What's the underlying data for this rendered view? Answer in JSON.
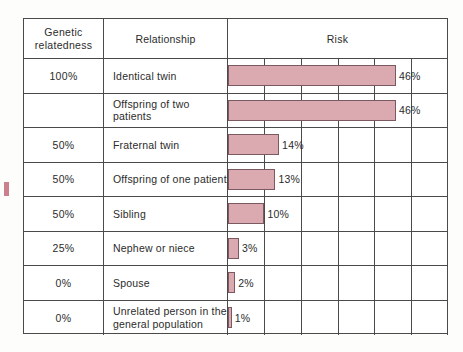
{
  "figure": {
    "headers": {
      "genetic": "Genetic\nrelatedness",
      "genetic_line1": "Genetic",
      "genetic_line2": "relatedness",
      "relationship": "Relationship",
      "risk": "Risk"
    },
    "artifact_glyph": "f"
  },
  "chart_data": {
    "type": "bar",
    "orientation": "horizontal",
    "title": "Risk",
    "xlabel": "",
    "ylabel": "",
    "xlim": [
      0,
      60
    ],
    "grid": true,
    "gridline_values": [
      10,
      20,
      30,
      40,
      50,
      60
    ],
    "bar_color": "#dba9b0",
    "bar_border_color": "#7a5a60",
    "categories": [
      "Identical twin",
      "Offspring of two patients",
      "Fraternal twin",
      "Offspring of one patient",
      "Sibling",
      "Nephew or niece",
      "Spouse",
      "Unrelated person in the general population"
    ],
    "values": [
      46,
      46,
      14,
      13,
      10,
      3,
      2,
      1
    ],
    "value_labels": [
      "46%",
      "46%",
      "14%",
      "13%",
      "10%",
      "3%",
      "2%",
      "1%"
    ],
    "rows": [
      {
        "genetic_relatedness": "100%",
        "relationship": "Identical twin",
        "relationship_line1": "Identical twin",
        "relationship_line2": "",
        "value": 46,
        "label": "46%"
      },
      {
        "genetic_relatedness": "",
        "relationship": "Offspring of two patients",
        "relationship_line1": "Offspring of two patients",
        "relationship_line2": "",
        "value": 46,
        "label": "46%"
      },
      {
        "genetic_relatedness": "50%",
        "relationship": "Fraternal twin",
        "relationship_line1": "Fraternal twin",
        "relationship_line2": "",
        "value": 14,
        "label": "14%"
      },
      {
        "genetic_relatedness": "50%",
        "relationship": "Offspring of one patient",
        "relationship_line1": "Offspring of one patient",
        "relationship_line2": "",
        "value": 13,
        "label": "13%"
      },
      {
        "genetic_relatedness": "50%",
        "relationship": "Sibling",
        "relationship_line1": "Sibling",
        "relationship_line2": "",
        "value": 10,
        "label": "10%"
      },
      {
        "genetic_relatedness": "25%",
        "relationship": "Nephew or niece",
        "relationship_line1": "Nephew or niece",
        "relationship_line2": "",
        "value": 3,
        "label": "3%"
      },
      {
        "genetic_relatedness": "0%",
        "relationship": "Spouse",
        "relationship_line1": "Spouse",
        "relationship_line2": "",
        "value": 2,
        "label": "2%"
      },
      {
        "genetic_relatedness": "0%",
        "relationship": "Unrelated person in the general population",
        "relationship_line1": "Unrelated person in the",
        "relationship_line2": "general population",
        "value": 1,
        "label": "1%"
      }
    ]
  }
}
